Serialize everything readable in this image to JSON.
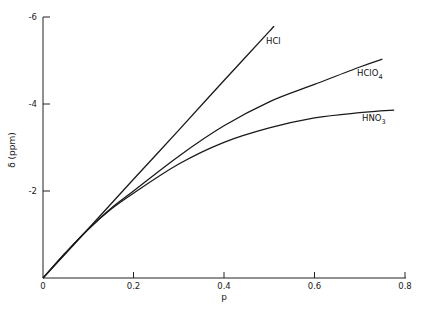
{
  "chart_data": {
    "type": "line",
    "title": "",
    "xlabel": "p",
    "ylabel": "δ (ppm)",
    "xlim": [
      0,
      0.8
    ],
    "ylim": [
      0,
      -6
    ],
    "x_ticks": [
      {
        "value": 0,
        "label": "0"
      },
      {
        "value": 0.2,
        "label": "0.2"
      },
      {
        "value": 0.4,
        "label": "0.4"
      },
      {
        "value": 0.6,
        "label": "0.6"
      },
      {
        "value": 0.8,
        "label": "0.8"
      }
    ],
    "y_ticks": [
      {
        "value": -2,
        "label": "-2"
      },
      {
        "value": -4,
        "label": "-4"
      },
      {
        "value": -6,
        "label": "-6"
      }
    ],
    "grid": false,
    "legend": "inline labels at line ends",
    "series": [
      {
        "name": "HCl",
        "label_main": "HCl",
        "label_sub": "",
        "x": [
          0,
          0.1,
          0.2,
          0.3,
          0.4,
          0.5,
          0.507
        ],
        "y": [
          0,
          -1.13,
          -2.27,
          -3.4,
          -4.54,
          -5.67,
          -5.75
        ]
      },
      {
        "name": "HClO4",
        "label_main": "HClO",
        "label_sub": "4",
        "x": [
          0,
          0.05,
          0.1,
          0.15,
          0.2,
          0.3,
          0.4,
          0.5,
          0.6,
          0.7,
          0.75
        ],
        "y": [
          0,
          -0.58,
          -1.12,
          -1.6,
          -2.0,
          -2.8,
          -3.5,
          -4.05,
          -4.45,
          -4.85,
          -5.03
        ]
      },
      {
        "name": "HNO3",
        "label_main": "HNO",
        "label_sub": "3",
        "x": [
          0,
          0.05,
          0.1,
          0.15,
          0.2,
          0.3,
          0.4,
          0.5,
          0.6,
          0.7,
          0.776
        ],
        "y": [
          0,
          -0.58,
          -1.12,
          -1.58,
          -1.95,
          -2.62,
          -3.12,
          -3.45,
          -3.68,
          -3.8,
          -3.86
        ]
      }
    ]
  }
}
